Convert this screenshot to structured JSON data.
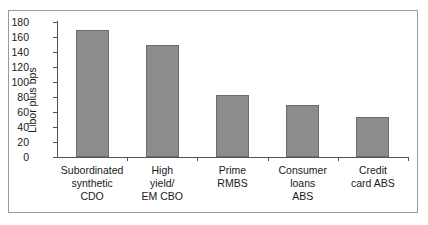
{
  "chart_data": {
    "type": "bar",
    "title": "",
    "xlabel": "",
    "ylabel": "Libor plus bps",
    "categories": [
      "Subordinated\nsynthetic\nCDO",
      "High\nyield/\nEM CBO",
      "Prime\nRMBS",
      "Consumer\nloans\nABS",
      "Credit\ncard ABS"
    ],
    "values": [
      169,
      149,
      83,
      69,
      53
    ],
    "ylim": [
      0,
      180
    ],
    "ytick_values": [
      0,
      20,
      40,
      60,
      80,
      100,
      120,
      140,
      160,
      180
    ],
    "ytick_labels": [
      "0",
      "20",
      "40",
      "60",
      "80",
      "100",
      "120",
      "140",
      "160",
      "180"
    ],
    "grid": false,
    "legend": "none",
    "bar_color": "#8c8c8c",
    "bar_edge_color": "#6d6d6d",
    "axis_color": "#545454",
    "frame_color": "#9a9a9a",
    "text_color": "#1a1a1a",
    "background": "#ffffff"
  }
}
